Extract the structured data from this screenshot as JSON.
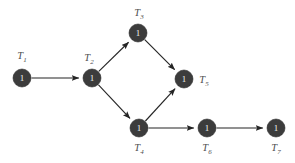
{
  "diagram": {
    "type": "directed-graph",
    "background_color": "#ffffff",
    "node_color": "#3c3c3c",
    "node_text_color": "#f2f2f2",
    "label_color": "#4f4f4f",
    "edge_color": "#252525",
    "node_radius": 9,
    "nodes": [
      {
        "id": "T1",
        "label_base": "T",
        "label_sub": "1",
        "value": "1",
        "cx": 22,
        "cy": 78,
        "label_x": 22,
        "label_y": 57,
        "label_pos": "above"
      },
      {
        "id": "T2",
        "label_base": "T",
        "label_sub": "2",
        "value": "1",
        "cx": 92,
        "cy": 78,
        "label_x": 89,
        "label_y": 59,
        "label_pos": "above-left"
      },
      {
        "id": "T3",
        "label_base": "T",
        "label_sub": "3",
        "value": "1",
        "cx": 138,
        "cy": 33,
        "label_x": 139,
        "label_y": 14,
        "label_pos": "above"
      },
      {
        "id": "T4",
        "label_base": "T",
        "label_sub": "4",
        "value": "1",
        "cx": 139,
        "cy": 128,
        "label_x": 139,
        "label_y": 149,
        "label_pos": "below"
      },
      {
        "id": "T5",
        "label_base": "T",
        "label_sub": "5",
        "value": "1",
        "cx": 184,
        "cy": 79,
        "label_x": 204,
        "label_y": 81,
        "label_pos": "right"
      },
      {
        "id": "T6",
        "label_base": "T",
        "label_sub": "6",
        "value": "1",
        "cx": 207,
        "cy": 128,
        "label_x": 207,
        "label_y": 149,
        "label_pos": "below"
      },
      {
        "id": "T7",
        "label_base": "T",
        "label_sub": "7",
        "value": "1",
        "cx": 276,
        "cy": 128,
        "label_x": 276,
        "label_y": 149,
        "label_pos": "below"
      }
    ],
    "edges": [
      {
        "from": "T1",
        "to": "T2"
      },
      {
        "from": "T2",
        "to": "T3"
      },
      {
        "from": "T2",
        "to": "T4"
      },
      {
        "from": "T3",
        "to": "T5"
      },
      {
        "from": "T4",
        "to": "T5"
      },
      {
        "from": "T4",
        "to": "T6"
      },
      {
        "from": "T6",
        "to": "T7"
      }
    ]
  }
}
